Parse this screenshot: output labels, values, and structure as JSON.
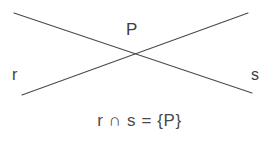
{
  "figure": {
    "width": 279,
    "height": 142,
    "background_color": "#ffffff",
    "line_color": "#4a4a4a",
    "text_color": "#3d3d3d"
  },
  "labels": {
    "point": "P",
    "line_r": "r",
    "line_s": "s"
  },
  "caption": {
    "text": "r ∩ s = {P}"
  },
  "lines": [
    {
      "name": "r",
      "from_x": 14,
      "from_y": 13,
      "to_x": 252,
      "to_y": 93
    },
    {
      "name": "s",
      "from_x": 22,
      "from_y": 95,
      "to_x": 248,
      "to_y": 13
    }
  ],
  "intersection": {
    "label": "P",
    "x": 133,
    "y": 53
  }
}
